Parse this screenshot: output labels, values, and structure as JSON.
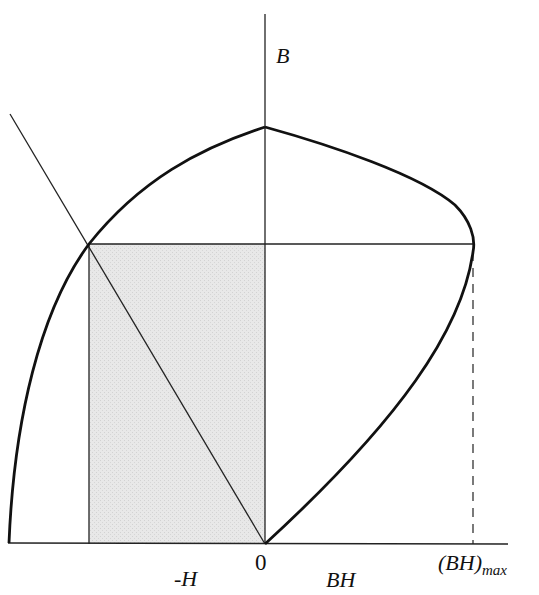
{
  "diagram": {
    "labels": {
      "b_axis": "B",
      "neg_h": "-H",
      "origin": "0",
      "bh": "BH",
      "bh_max_main": "(BH)",
      "bh_max_sub": "max"
    },
    "colors": {
      "line": "#111111",
      "shaded_region": "#e6e6e6",
      "background": "#ffffff"
    },
    "elements": [
      "vertical B axis",
      "horizontal baseline axis",
      "demagnetization curve (B vs -H)",
      "energy product curve (BH vs B)",
      "load line through origin",
      "shaded rectangle representing BH product",
      "horizontal line at operating B",
      "dashed vertical line at (BH)max"
    ]
  }
}
